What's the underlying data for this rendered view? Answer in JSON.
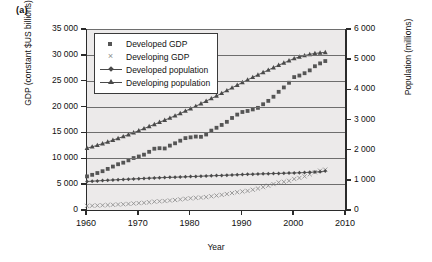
{
  "panel": {
    "label": "(a)"
  },
  "chart_data": {
    "type": "line",
    "title": "",
    "panel_label": "(a)",
    "xlabel": "Year",
    "ylabel": "GDP (constant $US billions)",
    "ylabel_secondary": "Population (millions)",
    "xlim": [
      1960,
      2010
    ],
    "xticks": [
      "1960",
      "1970",
      "1980",
      "1990",
      "2000",
      "2010"
    ],
    "xtick_values": [
      1960,
      1970,
      1980,
      1990,
      2000,
      2010
    ],
    "ylim": [
      0,
      35000
    ],
    "yticks": [
      "0",
      "5 000",
      "10 000",
      "15 000",
      "20 000",
      "25 000",
      "30 000",
      "35 000"
    ],
    "ytick_values": [
      0,
      5000,
      10000,
      15000,
      20000,
      25000,
      30000,
      35000
    ],
    "ylim_secondary": [
      0,
      6000
    ],
    "yticks_secondary": [
      "0",
      "1 000",
      "2 000",
      "3 000",
      "4 000",
      "5 000",
      "6 000"
    ],
    "ytick_values_secondary": [
      0,
      1000,
      2000,
      3000,
      4000,
      5000,
      6000
    ],
    "grid": "horizontal",
    "legend_position": "upper left inside",
    "plot_background": "#eceaea",
    "x": [
      1960,
      1961,
      1962,
      1963,
      1964,
      1965,
      1966,
      1967,
      1968,
      1969,
      1970,
      1971,
      1972,
      1973,
      1974,
      1975,
      1976,
      1977,
      1978,
      1979,
      1980,
      1981,
      1982,
      1983,
      1984,
      1985,
      1986,
      1987,
      1988,
      1989,
      1990,
      1991,
      1992,
      1993,
      1994,
      1995,
      1996,
      1997,
      1998,
      1999,
      2000,
      2001,
      2002,
      2003,
      2004,
      2005,
      2006
    ],
    "series": [
      {
        "name": "Developed GDP",
        "axis": "left",
        "unit": "constant $US billions",
        "marker": "square",
        "color": "#555555",
        "line": false,
        "values": [
          6500,
          6800,
          7150,
          7500,
          7950,
          8400,
          8850,
          9150,
          9600,
          10050,
          10350,
          10700,
          11250,
          11850,
          11950,
          11900,
          12450,
          12900,
          13400,
          13900,
          14050,
          14200,
          14150,
          14600,
          15350,
          15900,
          16450,
          17050,
          17800,
          18450,
          18950,
          19150,
          19450,
          19750,
          20450,
          21100,
          21900,
          22850,
          23700,
          24600,
          25700,
          26000,
          26450,
          27000,
          27800,
          28350,
          28800
        ]
      },
      {
        "name": "Developing GDP",
        "axis": "left",
        "unit": "constant $US billions",
        "marker": "x",
        "color": "#8d8d8d",
        "line": false,
        "values": [
          800,
          830,
          870,
          910,
          960,
          1010,
          1070,
          1110,
          1180,
          1260,
          1330,
          1400,
          1490,
          1610,
          1680,
          1740,
          1840,
          1930,
          2050,
          2170,
          2270,
          2350,
          2400,
          2500,
          2650,
          2790,
          2930,
          3090,
          3280,
          3440,
          3570,
          3700,
          3920,
          4150,
          4420,
          4700,
          5010,
          5330,
          5450,
          5650,
          6000,
          6200,
          6500,
          6900,
          7300,
          7600,
          7800
        ]
      },
      {
        "name": "Developed population",
        "axis": "right",
        "unit": "millions",
        "marker": "diamond",
        "color": "#4a4a4a",
        "line": true,
        "values": [
          945,
          955,
          965,
          975,
          985,
          995,
          1005,
          1013,
          1021,
          1030,
          1038,
          1047,
          1055,
          1062,
          1069,
          1076,
          1082,
          1088,
          1094,
          1100,
          1107,
          1114,
          1121,
          1128,
          1134,
          1140,
          1147,
          1154,
          1161,
          1168,
          1175,
          1182,
          1188,
          1193,
          1198,
          1203,
          1208,
          1213,
          1218,
          1223,
          1228,
          1234,
          1241,
          1249,
          1258,
          1270,
          1290
        ]
      },
      {
        "name": "Developing population",
        "axis": "right",
        "unit": "millions",
        "marker": "triangle",
        "color": "#4a4a4a",
        "line": true,
        "values": [
          2050,
          2095,
          2145,
          2200,
          2255,
          2315,
          2375,
          2435,
          2500,
          2565,
          2630,
          2700,
          2770,
          2840,
          2910,
          2980,
          3050,
          3125,
          3200,
          3280,
          3360,
          3440,
          3525,
          3610,
          3695,
          3780,
          3870,
          3960,
          4050,
          4140,
          4230,
          4315,
          4400,
          4480,
          4560,
          4640,
          4720,
          4800,
          4875,
          4950,
          5020,
          5075,
          5120,
          5160,
          5190,
          5210,
          5225
        ]
      }
    ]
  },
  "legend": {
    "items": [
      {
        "label": "Developed GDP",
        "key": "square-marker"
      },
      {
        "label": "Developing GDP",
        "key": "cross-marker"
      },
      {
        "label": "Developed population",
        "key": "line-diamond-marker"
      },
      {
        "label": "Developing population",
        "key": "line-triangle-marker"
      }
    ]
  },
  "axes": {
    "x_title": "Year",
    "y_left_title": "GDP (constant $US billions)",
    "y_right_title": "Population (millions)"
  }
}
